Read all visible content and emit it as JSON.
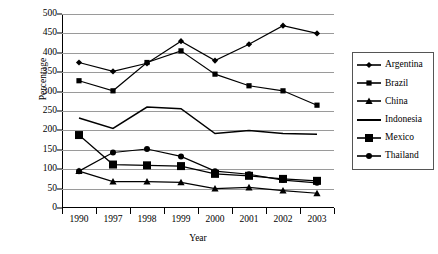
{
  "chart_data": {
    "type": "line",
    "title": "",
    "xlabel": "Year",
    "ylabel": "Percentage",
    "categories": [
      "1990",
      "1997",
      "1998",
      "1999",
      "2000",
      "2001",
      "2002",
      "2003"
    ],
    "ylim": [
      0,
      500
    ],
    "ytick_step": 50,
    "yticks": [
      0,
      50,
      100,
      150,
      200,
      250,
      300,
      350,
      400,
      450,
      500
    ],
    "grid": true,
    "legend_position": "right",
    "series": [
      {
        "name": "Argentina",
        "marker": "diamond",
        "values": [
          375,
          352,
          373,
          430,
          380,
          422,
          470,
          450
        ]
      },
      {
        "name": "Brazil",
        "marker": "square",
        "values": [
          328,
          302,
          375,
          405,
          345,
          315,
          302,
          265
        ]
      },
      {
        "name": "China",
        "marker": "triangle",
        "values": [
          95,
          68,
          68,
          66,
          50,
          53,
          45,
          38
        ]
      },
      {
        "name": "Indonesia",
        "marker": "none",
        "values": [
          232,
          205,
          260,
          256,
          192,
          200,
          192,
          190
        ]
      },
      {
        "name": "Mexico",
        "marker": "square-large",
        "values": [
          188,
          112,
          110,
          108,
          88,
          83,
          75,
          70
        ]
      },
      {
        "name": "Thailand",
        "marker": "circle",
        "values": [
          95,
          143,
          152,
          133,
          95,
          87,
          72,
          65
        ]
      }
    ]
  },
  "legend": {
    "items": [
      {
        "label": "Argentina"
      },
      {
        "label": "Brazil"
      },
      {
        "label": "China"
      },
      {
        "label": "Indonesia"
      },
      {
        "label": "Mexico"
      },
      {
        "label": "Thailand"
      }
    ]
  },
  "colors": {
    "series": "#000000",
    "grid": "#9a9a9a",
    "axis": "#000000",
    "legend_border": "#555555",
    "background": "#ffffff"
  }
}
